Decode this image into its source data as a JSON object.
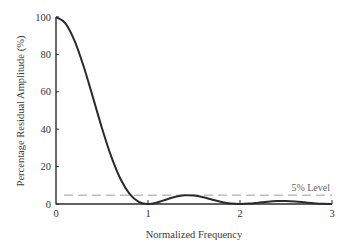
{
  "chart_data": {
    "type": "line",
    "title": "",
    "xlabel": "Normalized Frequency",
    "ylabel": "Percentage Residual Amplitude (%)",
    "xlim": [
      0,
      3
    ],
    "ylim": [
      0,
      100
    ],
    "grid": false,
    "legend": null,
    "x_ticks": [
      0,
      1,
      2,
      3
    ],
    "x_tick_labels": [
      "0",
      "1",
      "2",
      "3"
    ],
    "y_ticks": [
      0,
      20,
      40,
      60,
      80,
      100
    ],
    "y_tick_labels": [
      "0",
      "20",
      "40",
      "60",
      "80",
      "100"
    ],
    "series": [
      {
        "name": "Residual amplitude",
        "color": "#2b2b2b",
        "x": [
          0,
          0.1,
          0.2,
          0.3,
          0.4,
          0.5,
          0.6,
          0.7,
          0.8,
          0.9,
          1.0,
          1.1,
          1.2,
          1.3,
          1.4,
          1.5,
          1.6,
          1.7,
          1.8,
          1.9,
          2.0,
          2.1,
          2.2,
          2.3,
          2.4,
          2.5,
          2.6,
          2.7,
          2.8,
          2.9,
          3.0
        ],
        "values": [
          100,
          96.75,
          87.52,
          73.69,
          57.28,
          40.53,
          25.46,
          13.53,
          5.47,
          1.19,
          0,
          0.8,
          2.43,
          3.92,
          4.68,
          4.5,
          3.58,
          2.29,
          1.08,
          0.27,
          0,
          0.22,
          0.72,
          1.25,
          1.59,
          1.62,
          1.36,
          0.91,
          0.45,
          0.12,
          0
        ]
      }
    ],
    "annotations": [
      {
        "type": "hline",
        "y": 5,
        "style": "dashed",
        "color": "#9a9a9a",
        "label": "5% Level"
      }
    ]
  }
}
